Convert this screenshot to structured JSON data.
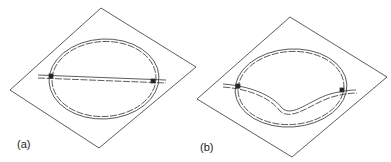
{
  "figure": {
    "panels": [
      {
        "id": "a",
        "label": "(a)",
        "description": "Oval ring track with a straight track crossing through it on a tilted plane"
      },
      {
        "id": "b",
        "label": "(b)",
        "description": "Oval ring track with a curved (dipping) track crossing through it on a tilted plane"
      }
    ],
    "colors": {
      "line": "#333333",
      "background": "#ffffff"
    }
  }
}
